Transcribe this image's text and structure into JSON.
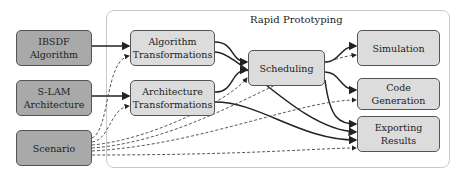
{
  "container": {
    "title": "Rapid Prototyping"
  },
  "inputs": [
    {
      "id": "ibsdf",
      "label": "IBSDF\nAlgorithm"
    },
    {
      "id": "slam",
      "label": "S-LAM\nArchitecture"
    },
    {
      "id": "scenario",
      "label": "Scenario"
    }
  ],
  "transforms": [
    {
      "id": "algo",
      "label": "Algorithm\nTransformations"
    },
    {
      "id": "arch",
      "label": "Architecture\nTransformations"
    }
  ],
  "scheduling": {
    "label": "Scheduling"
  },
  "outputs": [
    {
      "id": "sim",
      "label": "Simulation"
    },
    {
      "id": "code",
      "label": "Code\nGeneration"
    },
    {
      "id": "export",
      "label": "Exporting\nResults"
    }
  ],
  "colors": {
    "input_fill": "#a9a9a9",
    "process_fill": "#dcdcdc",
    "border": "#555555",
    "container_border": "#c8c8c8"
  }
}
